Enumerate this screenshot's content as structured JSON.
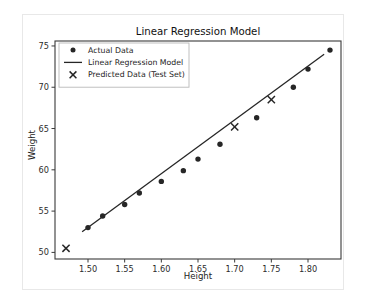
{
  "chart_data": {
    "type": "scatter",
    "title": "Linear Regression Model",
    "xlabel": "Height",
    "ylabel": "Weight",
    "xlim": [
      1.455,
      1.845
    ],
    "ylim": [
      49.2,
      75.6
    ],
    "xticks": [
      1.5,
      1.55,
      1.6,
      1.65,
      1.7,
      1.75,
      1.8
    ],
    "xticklabels": [
      "1.50",
      "1.55",
      "1.60",
      "1.65",
      "1.70",
      "1.75",
      "1.80"
    ],
    "yticks": [
      50,
      55,
      60,
      65,
      70,
      75
    ],
    "yticklabels": [
      "50",
      "55",
      "60",
      "65",
      "70",
      "75"
    ],
    "grid": false,
    "legend_position": "upper left",
    "series": [
      {
        "name": "Actual Data",
        "marker": "circle",
        "color": "#262626",
        "points": [
          {
            "x": 1.5,
            "y": 53.0
          },
          {
            "x": 1.52,
            "y": 54.4
          },
          {
            "x": 1.55,
            "y": 55.8
          },
          {
            "x": 1.57,
            "y": 57.2
          },
          {
            "x": 1.6,
            "y": 58.6
          },
          {
            "x": 1.63,
            "y": 59.9
          },
          {
            "x": 1.65,
            "y": 61.3
          },
          {
            "x": 1.68,
            "y": 63.1
          },
          {
            "x": 1.73,
            "y": 66.3
          },
          {
            "x": 1.78,
            "y": 70.0
          },
          {
            "x": 1.8,
            "y": 72.2
          },
          {
            "x": 1.83,
            "y": 74.5
          }
        ]
      },
      {
        "name": "Linear Regression Model",
        "marker": "line",
        "color": "#262626",
        "line_endpoints": [
          {
            "x": 1.492,
            "y": 52.5
          },
          {
            "x": 1.822,
            "y": 74.0
          }
        ]
      },
      {
        "name": "Predicted Data (Test Set)",
        "marker": "x",
        "color": "#262626",
        "points": [
          {
            "x": 1.47,
            "y": 50.5
          },
          {
            "x": 1.7,
            "y": 65.2
          },
          {
            "x": 1.75,
            "y": 68.5
          }
        ]
      }
    ]
  },
  "legend": {
    "entries": [
      {
        "label": "Actual Data",
        "marker": "circle"
      },
      {
        "label": "Linear Regression Model",
        "marker": "line"
      },
      {
        "label": "Predicted Data (Test Set)",
        "marker": "x"
      }
    ]
  },
  "colors": {
    "ink": "#262626",
    "axis": "#3a3a3a",
    "card_border": "#e8e8e8",
    "legend_border": "#b8b8b8",
    "background": "#ffffff"
  }
}
